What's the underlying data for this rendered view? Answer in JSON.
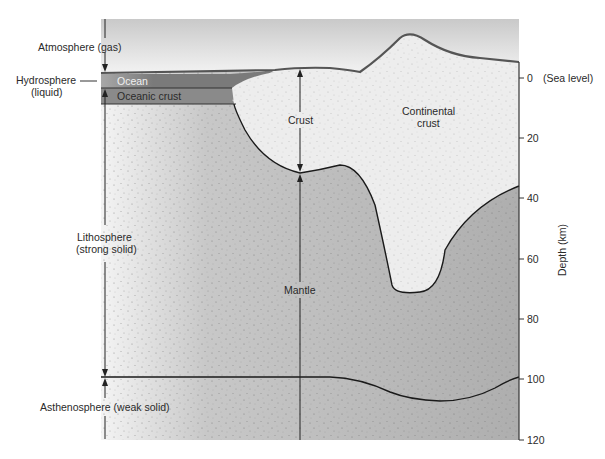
{
  "diagram": {
    "title": "",
    "labels": {
      "atmosphere": "Atmosphere (gas)",
      "hydrosphere_line1": "Hydrosphere",
      "hydrosphere_line2": "(liquid)",
      "ocean": "Ocean",
      "oceanic_crust": "Oceanic crust",
      "crust": "Crust",
      "continental_crust_line1": "Continental",
      "continental_crust_line2": "crust",
      "lithosphere_line1": "Lithosphere",
      "lithosphere_line2": "(strong solid)",
      "mantle": "Mantle",
      "asthenosphere": "Asthenosphere (weak solid)"
    },
    "axis": {
      "label": "Depth (km)",
      "ticks": [
        {
          "value": "0",
          "suffix": "(Sea level)"
        },
        {
          "value": "20",
          "suffix": ""
        },
        {
          "value": "40",
          "suffix": ""
        },
        {
          "value": "60",
          "suffix": ""
        },
        {
          "value": "80",
          "suffix": ""
        },
        {
          "value": "100",
          "suffix": ""
        },
        {
          "value": "120",
          "suffix": ""
        }
      ]
    },
    "colors": {
      "ocean": "#7a7a7a",
      "oceanic_crust": "#8c8c8c",
      "continental_crust": "#ececec",
      "mantle": "#b4b4b4",
      "atmosphere_top": "#c8c8c8",
      "outline": "#1a1a1a"
    }
  }
}
